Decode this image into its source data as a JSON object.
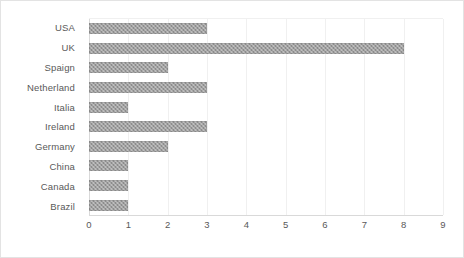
{
  "chart_data": {
    "type": "bar",
    "orientation": "horizontal",
    "title": "",
    "subtitle": "",
    "xlabel": "",
    "ylabel": "",
    "categories": [
      "USA",
      "UK",
      "Spaign",
      "Netherland",
      "Italia",
      "Ireland",
      "Germany",
      "China",
      "Canada",
      "Brazil"
    ],
    "values": [
      3,
      8,
      2,
      3,
      1,
      3,
      2,
      1,
      1,
      1
    ],
    "xlim": [
      0,
      9
    ],
    "xticks": [
      0,
      1,
      2,
      3,
      4,
      5,
      6,
      7,
      8,
      9
    ],
    "xtick_labels": [
      "0",
      "1",
      "2",
      "3",
      "4",
      "5",
      "6",
      "7",
      "8",
      "9"
    ],
    "grid": "vertical",
    "legend": "none",
    "series": [
      {
        "name": "",
        "values": [
          3,
          8,
          2,
          3,
          1,
          3,
          2,
          1,
          1,
          1
        ]
      }
    ],
    "colors": {
      "bar_fill": "#8c8c8c",
      "gridline": "#f0f0f0",
      "axis_line": "#d9d9d9",
      "tick_text": "#595959",
      "plot_background": "#ffffff",
      "frame_border": "#e3e3e3"
    }
  }
}
